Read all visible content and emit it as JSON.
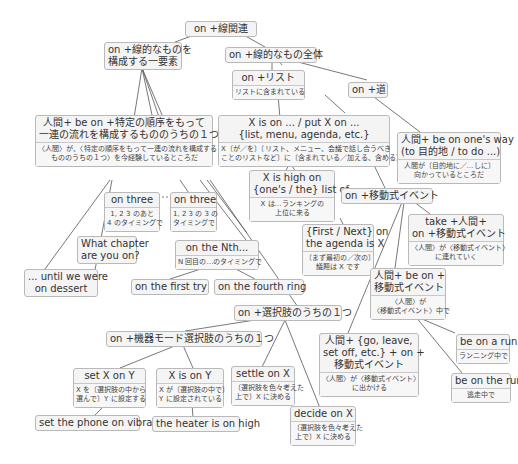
{
  "diagram": {
    "title": "on +線関連",
    "nodes": {
      "root": {
        "title": "on +線関連"
      },
      "linear_element": {
        "title": "on +線的なものを\n構成する一要素"
      },
      "linear_whole": {
        "title": "on +線的なもの全体"
      },
      "list": {
        "title": "on +リスト",
        "sub": "リストに含まれている"
      },
      "road": {
        "title": "on +道"
      },
      "ordered": {
        "title": "人間+ be on +特定の順序をもって\n一連の流れを構成するもののうちの１つ",
        "sub": "〈人間〉が、〈特定の順序をもって一連の流れを構成する\nもののうちの１つ〉を今経験しているところだ"
      },
      "x_is_on": {
        "title": "X is on ... / put X on ...\n{list, menu, agenda, etc.}",
        "sub": "X〔が／を〕〔リスト、メニュー、会議で話し合うべき\nことのリストなど〕に〔含まれている／加える、含める〕"
      },
      "on_ones_way": {
        "title": "人間+ be on one's way\n(to 目的地 / to do ...)",
        "sub": "人間が〔目的地に／…しに〕\n向かっているところだ"
      },
      "on_three_a": {
        "title": "on three",
        "sub": "1, 2 3 のあと\n4 のタイミングで"
      },
      "on_three_b": {
        "title": "on three",
        "sub": "1, 2 3 の 3 の\nタイミングで"
      },
      "high_on_list": {
        "title": "X is high on\n{one's / the} list of ...",
        "sub": "X は…ランキングの\n上位に来る"
      },
      "moving_event": {
        "title": "on +移動式イベント"
      },
      "what_chapter": {
        "title": "What chapter\nare you on?"
      },
      "first_next": {
        "title": "{First / Next} on\nthe agenda is X",
        "sub": "〔まず最初の／次の〕\n議題は X です"
      },
      "take_person": {
        "title": "take +人間+\non +移動式イベント",
        "sub": "〈人間〉が〈移動式イベント〉\nに連れていく"
      },
      "nth": {
        "title": "on the Nth...",
        "sub": "N 回目の…のタイミングで"
      },
      "until_dessert": {
        "title": "... until we were\non dessert"
      },
      "first_try": {
        "title": "on the first try"
      },
      "fourth_ring": {
        "title": "on the fourth ring"
      },
      "be_on_event": {
        "title": "人間+ be on +\n移動式イベント",
        "sub": "〈人間〉が\n〈移動式イベント〉中で"
      },
      "choice": {
        "title": "on +選択肢のうちの１つ"
      },
      "device_mode": {
        "title": "on +機器モード選択肢のうちの１つ"
      },
      "go_leave": {
        "title": "人間+ {go, leave,\nset off, etc.} + on +\n移動式イベント",
        "sub": "〈人間〉が〈移動式イベント〉\nに出かける"
      },
      "be_on_a_run": {
        "title": "be on a run",
        "sub": "ランニング中で"
      },
      "set_x_on_y": {
        "title": "set X on Y",
        "sub": "X を〔選択肢の中から\n選んで〕Y に設定する"
      },
      "x_is_on_y": {
        "title": "X is on Y",
        "sub": "X が〔選択肢の中で〕\nY に設定されている"
      },
      "settle_on_x": {
        "title": "settle on X",
        "sub": "〔選択肢を色々考えた\n上で〕X に決める"
      },
      "be_on_the_run": {
        "title": "be on the run",
        "sub": "逃走中で"
      },
      "decide_on_x": {
        "title": "decide on X",
        "sub": "〔選択肢を色々考えた\n上で〕X に決める"
      },
      "phone_vibrate": {
        "title": "set the phone on vibrate"
      },
      "heater_high": {
        "title": "the heater is on high"
      }
    }
  },
  "colors": {
    "node_bg": "#f4f4f4",
    "node_border": "#b9b9b9",
    "line": "#555555",
    "text": "#333333"
  }
}
